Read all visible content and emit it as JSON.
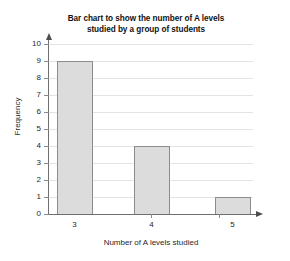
{
  "chart_data": {
    "type": "bar",
    "title": "Bar chart to show the number of A levels studied by a group of students",
    "title_lines": [
      "Bar chart to show the number of A levels",
      "studied by a group of students"
    ],
    "categories": [
      "3",
      "4",
      "5"
    ],
    "values": [
      9,
      4,
      1
    ],
    "xlabel": "Number of A levels studied",
    "ylabel": "Frequency",
    "ylim": [
      0,
      10
    ],
    "ytick_labels": [
      "0",
      "1",
      "2",
      "3",
      "4",
      "5",
      "6",
      "7",
      "8",
      "9",
      "10"
    ],
    "ytick_step": 1,
    "grid": true,
    "grid_axis": "y",
    "legend": null,
    "bar_fill_color": "#dcdcdc",
    "bar_border_color": "#8c8c8c",
    "gridline_color": "#e3e3e3",
    "axis_color": "#6e6e6e",
    "axis_arrows": true
  }
}
